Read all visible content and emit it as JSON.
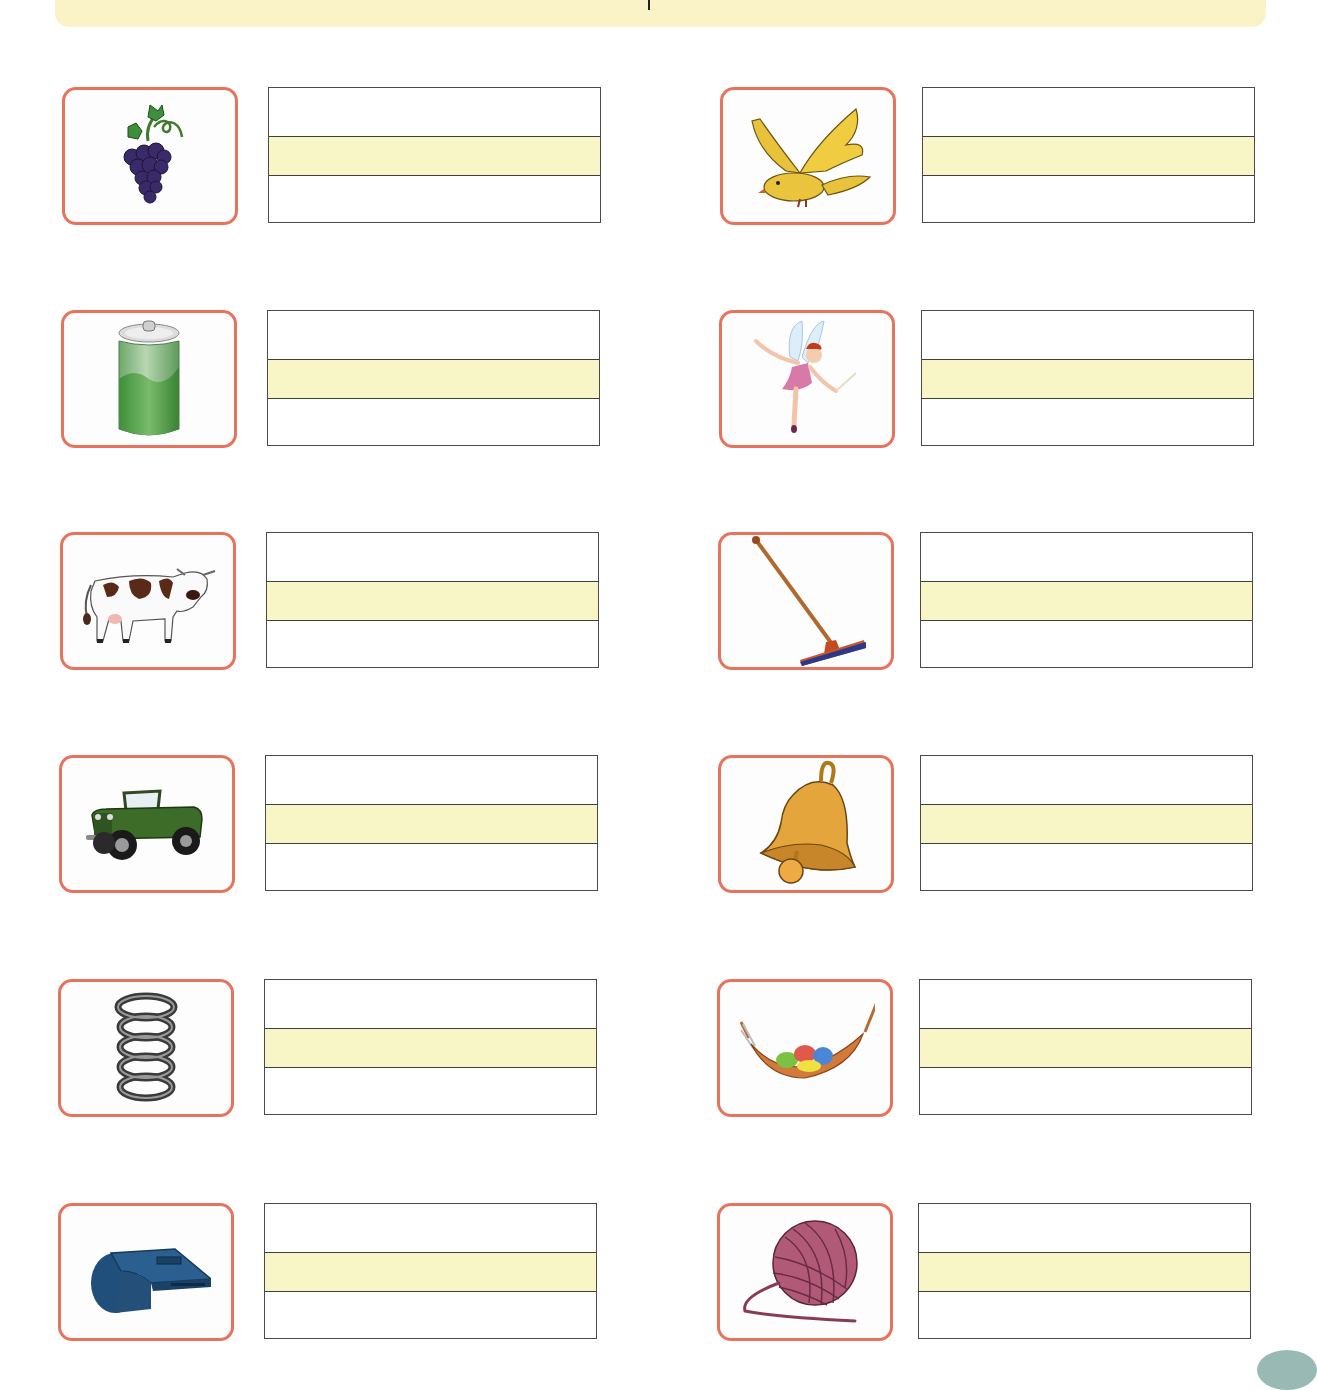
{
  "worksheet": {
    "type": "picture-word writing practice",
    "banner": {
      "color": "#fbf3c8",
      "text": ""
    },
    "colors": {
      "frame_border": "#e8735c",
      "box_border": "#4a4a4a",
      "guide_band": "#f8f5c6"
    },
    "left_column": [
      {
        "picture": "grapes-icon",
        "answer": ""
      },
      {
        "picture": "soda-can-icon",
        "answer": ""
      },
      {
        "picture": "cow-icon",
        "answer": ""
      },
      {
        "picture": "jeep-icon",
        "answer": ""
      },
      {
        "picture": "spring-coil-icon",
        "answer": ""
      },
      {
        "picture": "whistle-icon",
        "answer": ""
      }
    ],
    "right_column": [
      {
        "picture": "bird-icon",
        "answer": ""
      },
      {
        "picture": "fairy-icon",
        "answer": ""
      },
      {
        "picture": "mop-icon",
        "answer": ""
      },
      {
        "picture": "bell-icon",
        "answer": ""
      },
      {
        "picture": "hammock-icon",
        "answer": ""
      },
      {
        "picture": "yarn-ball-icon",
        "answer": ""
      }
    ]
  }
}
